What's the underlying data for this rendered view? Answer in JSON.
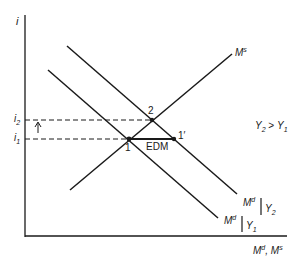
{
  "axes": {
    "y_label": "i",
    "x_label_main": "M",
    "x_label_sup1": "d",
    "x_label_sep": ", ",
    "x_label_main2": "M",
    "x_label_sup2": "s"
  },
  "ticks": {
    "i2_main": "i",
    "i2_sub": "2",
    "i1_main": "i",
    "i1_sub": "1"
  },
  "curves": {
    "ms_main": "M",
    "ms_sup": "s",
    "md2_main": "M",
    "md2_sup": "d",
    "md2_cond": "Y",
    "md2_cond_sub": "2",
    "md1_main": "M",
    "md1_sup": "d",
    "md1_cond": "Y",
    "md1_cond_sub": "1"
  },
  "points": {
    "p1": "1",
    "p2": "2",
    "p1prime": "1′"
  },
  "annotations": {
    "edm": "EDM",
    "cond_y2": "Y",
    "cond_y2_sub": "2",
    "cond_gt": " > ",
    "cond_y1": "Y",
    "cond_y1_sub": "1"
  },
  "colors": {
    "ink": "#1a1a1a",
    "background": "#ffffff"
  }
}
